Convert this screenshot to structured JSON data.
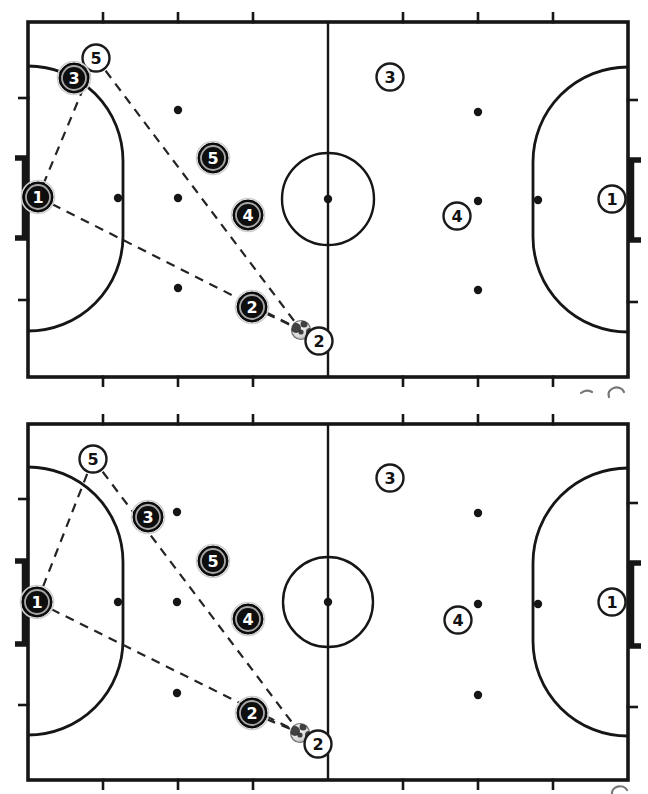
{
  "page": {
    "background": "#ffffff",
    "ink_color": "#161616",
    "dash_color": "#242424",
    "token_black_fill": "#0e0e0e",
    "token_black_text": "#ffffff",
    "token_ring_color": "#a8a8a8",
    "token_halo_color": "#cfcfcf",
    "token_white_fill": "#ffffff",
    "token_white_stroke": "#1b1b1b",
    "token_white_text": "#111111",
    "ball_edge": "#6f6f6f",
    "ball_patch": "#2e2e2e",
    "artifact_color": "#4a4a4a"
  },
  "diagrams": [
    {
      "name": "phase-1",
      "court": {
        "x": 28,
        "y": 22,
        "w": 600,
        "h": 355
      },
      "halfway_x": 328,
      "centre_circle": {
        "cx": 328,
        "cy": 199,
        "r": 46
      },
      "penalty_area": {
        "r": 95,
        "y1": 161,
        "y2": 236
      },
      "goal": {
        "y1": 158,
        "y2": 238,
        "depth": 13
      },
      "ticks": {
        "x": [
          103,
          178,
          253,
          403,
          478,
          553
        ],
        "left_y": [
          98,
          300
        ],
        "right_y": [
          100,
          302
        ]
      },
      "dots": [
        [
          118,
          198
        ],
        [
          178,
          110
        ],
        [
          178,
          198
        ],
        [
          178,
          288
        ],
        [
          328,
          199
        ],
        [
          478,
          112
        ],
        [
          478,
          201
        ],
        [
          478,
          290
        ],
        [
          538,
          200
        ]
      ],
      "players_black": [
        {
          "label": "1",
          "x": 38,
          "y": 197
        },
        {
          "label": "2",
          "x": 252,
          "y": 307
        },
        {
          "label": "3",
          "x": 74,
          "y": 78
        },
        {
          "label": "4",
          "x": 248,
          "y": 215
        },
        {
          "label": "5",
          "x": 213,
          "y": 158
        }
      ],
      "players_white": [
        {
          "label": "1",
          "x": 612,
          "y": 199
        },
        {
          "label": "2",
          "x": 319,
          "y": 341
        },
        {
          "label": "3",
          "x": 390,
          "y": 77
        },
        {
          "label": "4",
          "x": 457,
          "y": 216
        },
        {
          "label": "5",
          "x": 96,
          "y": 58
        }
      ],
      "ball": {
        "x": 301,
        "y": 330
      },
      "dashed_lines": [
        [
          96,
          58,
          38,
          197
        ],
        [
          96,
          58,
          301,
          330
        ],
        [
          38,
          197,
          301,
          330
        ],
        [
          252,
          307,
          301,
          330
        ]
      ]
    },
    {
      "name": "phase-2",
      "court": {
        "x": 28,
        "y": 424,
        "w": 600,
        "h": 356
      },
      "halfway_x": 328,
      "centre_circle": {
        "cx": 328,
        "cy": 602,
        "r": 45
      },
      "penalty_area": {
        "r": 95,
        "y1": 562,
        "y2": 640
      },
      "goal": {
        "y1": 561,
        "y2": 644,
        "depth": 13
      },
      "ticks": {
        "x": [
          103,
          178,
          253,
          403,
          478,
          553
        ],
        "left_y": [
          499,
          705
        ],
        "right_y": [
          503,
          707
        ]
      },
      "dots": [
        [
          118,
          602
        ],
        [
          177,
          512
        ],
        [
          177,
          602
        ],
        [
          177,
          693
        ],
        [
          328,
          602
        ],
        [
          478,
          513
        ],
        [
          478,
          604
        ],
        [
          478,
          695
        ],
        [
          538,
          604
        ]
      ],
      "players_black": [
        {
          "label": "1",
          "x": 37,
          "y": 602
        },
        {
          "label": "2",
          "x": 252,
          "y": 713
        },
        {
          "label": "3",
          "x": 148,
          "y": 517
        },
        {
          "label": "4",
          "x": 248,
          "y": 619
        },
        {
          "label": "5",
          "x": 213,
          "y": 561
        }
      ],
      "players_white": [
        {
          "label": "1",
          "x": 612,
          "y": 602
        },
        {
          "label": "2",
          "x": 318,
          "y": 744
        },
        {
          "label": "3",
          "x": 390,
          "y": 478
        },
        {
          "label": "4",
          "x": 458,
          "y": 620
        },
        {
          "label": "5",
          "x": 93,
          "y": 459
        }
      ],
      "ball": {
        "x": 300,
        "y": 733
      },
      "dashed_lines": [
        [
          93,
          459,
          37,
          602
        ],
        [
          93,
          459,
          300,
          733
        ],
        [
          37,
          602,
          300,
          733
        ],
        [
          252,
          713,
          300,
          733
        ]
      ]
    }
  ],
  "artifacts": [
    {
      "id": "scan-smudge-dash",
      "d": "M 581 393 Q 586 389 592 392"
    },
    {
      "id": "scan-smudge-circle-top",
      "d": "M 609 397 A 8 7 0 1 1 624 392"
    },
    {
      "id": "scan-smudge-circle-bottom",
      "d": "M 612 794 A 8 7 0 0 1 627 790"
    }
  ]
}
